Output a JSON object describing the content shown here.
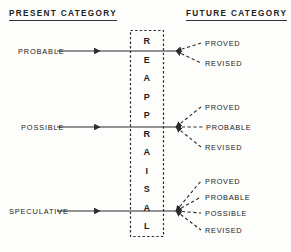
{
  "headers": {
    "left": "PRESENT  CATEGORY",
    "right": "FUTURE  CATEGORY"
  },
  "center_box": {
    "word": "REAPPRAISAL",
    "letters": [
      "R",
      "E",
      "A",
      "P",
      "P",
      "R",
      "A",
      "I",
      "S",
      "A",
      "L"
    ],
    "border_style": "dashed",
    "border_color": "#2b2b2b"
  },
  "colors": {
    "ink": "#222222",
    "line": "#333333",
    "background": "#fdfdfc"
  },
  "rows": [
    {
      "source": "PROBABLE",
      "outcomes": [
        "PROVED",
        "REVISED"
      ]
    },
    {
      "source": "POSSIBLE",
      "outcomes": [
        "PROVED",
        "PROBABLE",
        "REVISED"
      ]
    },
    {
      "source": "SPECULATIVE",
      "outcomes": [
        "PROVED",
        "PROBABLE",
        "POSSIBLE",
        "REVISED"
      ]
    }
  ]
}
